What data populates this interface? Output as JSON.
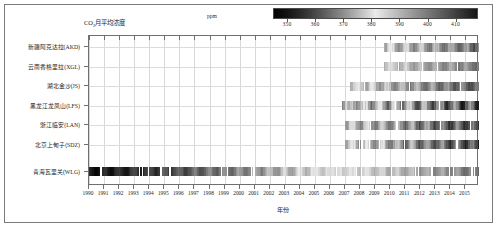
{
  "figure": {
    "title_main": "CO",
    "title_sub": "2",
    "title_rest": "月平均浓度",
    "xaxis_title": "年份",
    "unit_label": "ppm"
  },
  "colorbar": {
    "ticks": [
      350,
      360,
      370,
      380,
      390,
      400,
      410
    ],
    "tick_labels": [
      "350",
      "360",
      "370",
      "380",
      "390",
      "400",
      "410"
    ],
    "vmin": 345,
    "vmax": 418,
    "unit": "ppm",
    "colormap": "grayscale-dark-to-light-to-dark",
    "color_low": "#000000",
    "color_mid": "#e8e8e8",
    "color_high": "#1a1a1a"
  },
  "chart_data": {
    "type": "heatmap",
    "xlabel": "年份",
    "ylabel": "",
    "xlim": [
      1990,
      2015.9
    ],
    "grid": true,
    "legend_position": "top-right-colorbar",
    "value_unit": "ppm",
    "value_range": [
      345,
      418
    ],
    "x_tick_labels": [
      "1990",
      "1991",
      "1992",
      "1993",
      "1994",
      "1995",
      "1996",
      "1997",
      "1998",
      "1999",
      "2000",
      "2001",
      "2002",
      "2003",
      "2004",
      "2005",
      "2006",
      "2007",
      "2008",
      "2009",
      "2010",
      "2011",
      "2012",
      "2013",
      "2014",
      "2015"
    ],
    "categories": [
      "新疆阿克达拉(AKD)",
      "云南香格里拉(XGL)",
      "湖北金沙(JS)",
      "黑龙江龙凤山(LFS)",
      "浙江临安(LAN)",
      "北京上甸子(SDZ)",
      "青海瓦里关(WLG)"
    ],
    "series": [
      {
        "name": "新疆阿克达拉(AKD)",
        "station_code": "AKD",
        "station_name": "新疆阿克达拉",
        "data_start_year": 2009.6,
        "data_end_year": 2015.9,
        "mean_value": 394,
        "trend_ppm_per_year": 2.2,
        "seasonal_amplitude": 14
      },
      {
        "name": "云南香格里拉(XGL)",
        "station_code": "XGL",
        "station_name": "云南香格里拉",
        "data_start_year": 2009.6,
        "data_end_year": 2015.9,
        "mean_value": 393,
        "trend_ppm_per_year": 2.1,
        "seasonal_amplitude": 9
      },
      {
        "name": "湖北金沙(JS)",
        "station_code": "JS",
        "station_name": "湖北金沙",
        "data_start_year": 2007.3,
        "data_end_year": 2015.9,
        "mean_value": 395,
        "trend_ppm_per_year": 2.3,
        "seasonal_amplitude": 12
      },
      {
        "name": "黑龙江龙凤山(LFS)",
        "station_code": "LFS",
        "station_name": "黑龙江龙凤山",
        "data_start_year": 2006.8,
        "data_end_year": 2015.9,
        "mean_value": 396,
        "trend_ppm_per_year": 2.4,
        "seasonal_amplitude": 22
      },
      {
        "name": "浙江临安(LAN)",
        "station_code": "LAN",
        "station_name": "浙江临安",
        "data_start_year": 2007.0,
        "data_end_year": 2015.9,
        "mean_value": 398,
        "trend_ppm_per_year": 2.3,
        "seasonal_amplitude": 16
      },
      {
        "name": "北京上甸子(SDZ)",
        "station_code": "SDZ",
        "station_name": "北京上甸子",
        "data_start_year": 2007.0,
        "data_end_year": 2015.9,
        "mean_value": 397,
        "trend_ppm_per_year": 2.4,
        "seasonal_amplitude": 18
      },
      {
        "name": "青海瓦里关(WLG)",
        "station_code": "WLG",
        "station_name": "青海瓦里关",
        "data_start_year": 1990.0,
        "data_end_year": 2015.9,
        "mean_value": 375,
        "trend_ppm_per_year": 1.95,
        "seasonal_amplitude": 8
      }
    ]
  }
}
